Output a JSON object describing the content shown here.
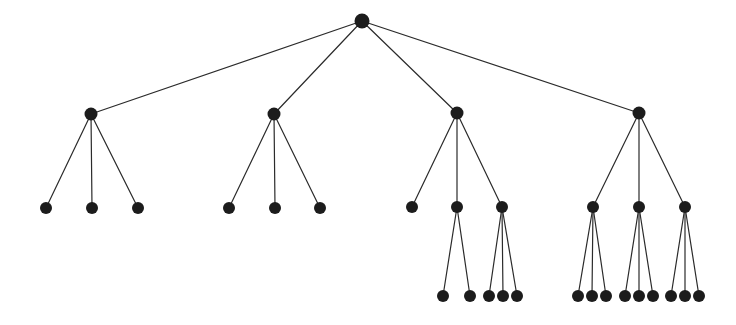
{
  "figure": {
    "name": "hierarchical-tree-diagram",
    "width": 736,
    "height": 325,
    "background_color": "#ffffff",
    "node_color": "#1c1c1c",
    "edge_color": "#2b2b2b",
    "edge_width": 1.2,
    "levels": 4,
    "level_y": [
      21,
      114,
      207,
      296
    ],
    "total_nodes": 32
  },
  "chart_data": {
    "type": "diagram",
    "title": "",
    "nodes": [
      {
        "id": "root",
        "x": 362,
        "y": 21,
        "r": 7.5,
        "level": 0,
        "label": ""
      },
      {
        "id": "n1",
        "x": 91,
        "y": 114,
        "r": 6.5,
        "level": 1,
        "label": ""
      },
      {
        "id": "n2",
        "x": 274,
        "y": 114,
        "r": 6.5,
        "level": 1,
        "label": ""
      },
      {
        "id": "n3",
        "x": 457,
        "y": 113,
        "r": 6.5,
        "level": 1,
        "label": ""
      },
      {
        "id": "n4",
        "x": 639,
        "y": 113,
        "r": 6.5,
        "level": 1,
        "label": ""
      },
      {
        "id": "n1a",
        "x": 46,
        "y": 208,
        "r": 6.0,
        "level": 2,
        "label": ""
      },
      {
        "id": "n1b",
        "x": 92,
        "y": 208,
        "r": 6.0,
        "level": 2,
        "label": ""
      },
      {
        "id": "n1c",
        "x": 138,
        "y": 208,
        "r": 6.0,
        "level": 2,
        "label": ""
      },
      {
        "id": "n2a",
        "x": 229,
        "y": 208,
        "r": 6.0,
        "level": 2,
        "label": ""
      },
      {
        "id": "n2b",
        "x": 275,
        "y": 208,
        "r": 6.0,
        "level": 2,
        "label": ""
      },
      {
        "id": "n2c",
        "x": 320,
        "y": 208,
        "r": 6.0,
        "level": 2,
        "label": ""
      },
      {
        "id": "n3a",
        "x": 412,
        "y": 207,
        "r": 6.0,
        "level": 2,
        "label": ""
      },
      {
        "id": "n3b",
        "x": 457,
        "y": 207,
        "r": 6.0,
        "level": 2,
        "label": ""
      },
      {
        "id": "n3c",
        "x": 502,
        "y": 207,
        "r": 6.0,
        "level": 2,
        "label": ""
      },
      {
        "id": "n4a",
        "x": 593,
        "y": 207,
        "r": 6.0,
        "level": 2,
        "label": ""
      },
      {
        "id": "n4b",
        "x": 639,
        "y": 207,
        "r": 6.0,
        "level": 2,
        "label": ""
      },
      {
        "id": "n4c",
        "x": 685,
        "y": 207,
        "r": 6.0,
        "level": 2,
        "label": ""
      },
      {
        "id": "n3b1",
        "x": 443,
        "y": 296,
        "r": 6.0,
        "level": 3,
        "label": ""
      },
      {
        "id": "n3b2",
        "x": 470,
        "y": 296,
        "r": 6.0,
        "level": 3,
        "label": ""
      },
      {
        "id": "n3c1",
        "x": 489,
        "y": 296,
        "r": 6.0,
        "level": 3,
        "label": ""
      },
      {
        "id": "n3c2",
        "x": 503,
        "y": 296,
        "r": 6.0,
        "level": 3,
        "label": ""
      },
      {
        "id": "n3c3",
        "x": 517,
        "y": 296,
        "r": 6.0,
        "level": 3,
        "label": ""
      },
      {
        "id": "n4a1",
        "x": 578,
        "y": 296,
        "r": 6.0,
        "level": 3,
        "label": ""
      },
      {
        "id": "n4a2",
        "x": 592,
        "y": 296,
        "r": 6.0,
        "level": 3,
        "label": ""
      },
      {
        "id": "n4a3",
        "x": 606,
        "y": 296,
        "r": 6.0,
        "level": 3,
        "label": ""
      },
      {
        "id": "n4b1",
        "x": 625,
        "y": 296,
        "r": 6.0,
        "level": 3,
        "label": ""
      },
      {
        "id": "n4b2",
        "x": 639,
        "y": 296,
        "r": 6.0,
        "level": 3,
        "label": ""
      },
      {
        "id": "n4b3",
        "x": 653,
        "y": 296,
        "r": 6.0,
        "level": 3,
        "label": ""
      },
      {
        "id": "n4c1",
        "x": 671,
        "y": 296,
        "r": 6.0,
        "level": 3,
        "label": ""
      },
      {
        "id": "n4c2",
        "x": 685,
        "y": 296,
        "r": 6.0,
        "level": 3,
        "label": ""
      },
      {
        "id": "n4c3",
        "x": 699,
        "y": 296,
        "r": 6.0,
        "level": 3,
        "label": ""
      }
    ],
    "edges": [
      {
        "from": "root",
        "to": "n1"
      },
      {
        "from": "root",
        "to": "n2"
      },
      {
        "from": "root",
        "to": "n3"
      },
      {
        "from": "root",
        "to": "n4"
      },
      {
        "from": "n1",
        "to": "n1a"
      },
      {
        "from": "n1",
        "to": "n1b"
      },
      {
        "from": "n1",
        "to": "n1c"
      },
      {
        "from": "n2",
        "to": "n2a"
      },
      {
        "from": "n2",
        "to": "n2b"
      },
      {
        "from": "n2",
        "to": "n2c"
      },
      {
        "from": "n3",
        "to": "n3a"
      },
      {
        "from": "n3",
        "to": "n3b"
      },
      {
        "from": "n3",
        "to": "n3c"
      },
      {
        "from": "n4",
        "to": "n4a"
      },
      {
        "from": "n4",
        "to": "n4b"
      },
      {
        "from": "n4",
        "to": "n4c"
      },
      {
        "from": "n3b",
        "to": "n3b1"
      },
      {
        "from": "n3b",
        "to": "n3b2"
      },
      {
        "from": "n3c",
        "to": "n3c1"
      },
      {
        "from": "n3c",
        "to": "n3c2"
      },
      {
        "from": "n3c",
        "to": "n3c3"
      },
      {
        "from": "n4a",
        "to": "n4a1"
      },
      {
        "from": "n4a",
        "to": "n4a2"
      },
      {
        "from": "n4a",
        "to": "n4a3"
      },
      {
        "from": "n4b",
        "to": "n4b1"
      },
      {
        "from": "n4b",
        "to": "n4b2"
      },
      {
        "from": "n4b",
        "to": "n4b3"
      },
      {
        "from": "n4c",
        "to": "n4c1"
      },
      {
        "from": "n4c",
        "to": "n4c2"
      },
      {
        "from": "n4c",
        "to": "n4c3"
      }
    ]
  }
}
